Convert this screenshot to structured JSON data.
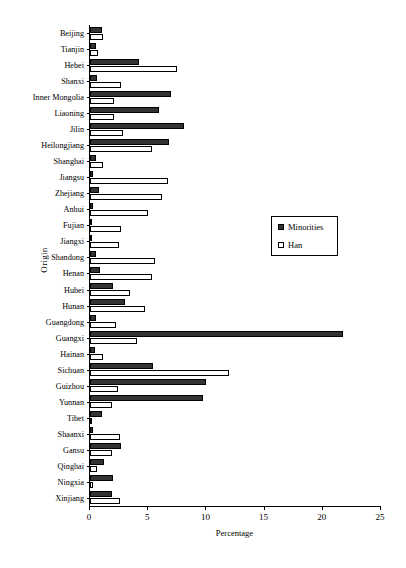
{
  "chart_data": {
    "type": "bar",
    "orientation": "horizontal",
    "title": "",
    "xlabel": "Percentage",
    "ylabel": "Origin",
    "xlim": [
      0,
      25
    ],
    "xticks": [
      0,
      5,
      10,
      15,
      20,
      25
    ],
    "grid": false,
    "legend_position": "middle-right",
    "categories": [
      "Beijing",
      "Tianjin",
      "Hebei",
      "Shanxi",
      "Inner Mongolia",
      "Liaoning",
      "Jilin",
      "Heilongjiang",
      "Shanghai",
      "Jiangsu",
      "Zhejiang",
      "Anhui",
      "Fujian",
      "Jiangxi",
      "Shandong",
      "Henan",
      "Hubei",
      "Hunan",
      "Guangdong",
      "Guangxi",
      "Hainan",
      "Sichuan",
      "Guizhou",
      "Yunnan",
      "Tibet",
      "Shaanxi",
      "Gansu",
      "Qinghai",
      "Ningxia",
      "Xinjiang"
    ],
    "series": [
      {
        "name": "Minorities",
        "color": "#333333",
        "values": [
          1.0,
          0.5,
          4.2,
          0.6,
          7.0,
          5.9,
          8.1,
          6.8,
          0.5,
          0.3,
          0.8,
          0.3,
          0.2,
          0.2,
          0.5,
          0.9,
          2.0,
          3.0,
          0.5,
          21.7,
          0.4,
          5.4,
          10.0,
          9.7,
          1.0,
          0.3,
          2.7,
          1.2,
          2.0,
          1.9
        ]
      },
      {
        "name": "Han",
        "color": "#ffffff",
        "values": [
          1.1,
          0.7,
          7.5,
          2.7,
          2.1,
          2.1,
          2.8,
          5.3,
          1.1,
          6.7,
          6.2,
          5.0,
          2.7,
          2.5,
          5.6,
          5.3,
          3.4,
          4.7,
          2.2,
          4.0,
          1.1,
          11.9,
          2.4,
          1.9,
          0.2,
          2.6,
          1.9,
          0.6,
          0.3,
          2.6
        ]
      }
    ]
  },
  "legend": {
    "items": [
      {
        "label": "Minorities",
        "swatch": "minorities"
      },
      {
        "label": "Han",
        "swatch": "han"
      }
    ]
  }
}
